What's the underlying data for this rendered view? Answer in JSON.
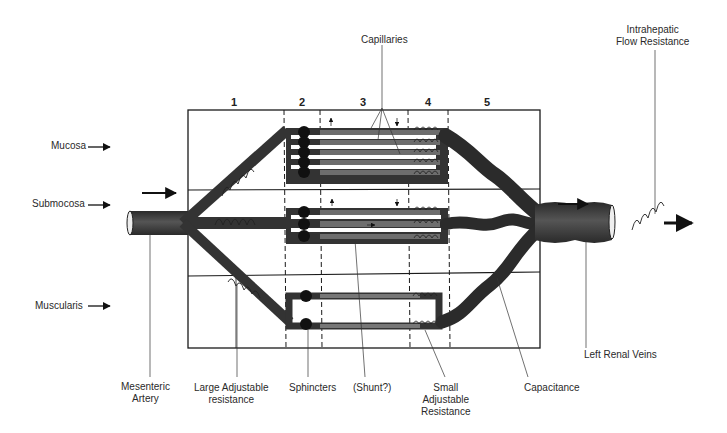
{
  "diagram": {
    "type": "schematic",
    "columns": [
      {
        "id": 1,
        "label": "1",
        "x": 234
      },
      {
        "id": 2,
        "label": "2",
        "x": 302
      },
      {
        "id": 3,
        "label": "3",
        "x": 363
      },
      {
        "id": 4,
        "label": "4",
        "x": 428
      },
      {
        "id": 5,
        "label": "5",
        "x": 487
      }
    ],
    "layers": [
      {
        "name": "Mucosa",
        "label": "Mucosa"
      },
      {
        "name": "Submucosa",
        "label": "Submocosa"
      },
      {
        "name": "Muscularis",
        "label": "Muscularis"
      }
    ],
    "top_labels": {
      "capillaries": "Capillaries",
      "intrahepatic_line1": "Intrahepatic",
      "intrahepatic_line2": "Flow Resistance"
    },
    "bottom_labels": {
      "mesenteric_line1": "Mesenteric",
      "mesenteric_line2": "Artery",
      "large_res_line1": "Large Adjustable",
      "large_res_line2": "resistance",
      "sphincters": "Sphincters",
      "shunt": "(Shunt?)",
      "small_res_line1": "Small",
      "small_res_line2": "Adjustable",
      "small_res_line3": "Resistance",
      "capacitance": "Capacitance",
      "left_renal_veins": "Left Renal Veins"
    },
    "colors": {
      "vessel": "#3a3a3a",
      "capillary": "#6a6a6a",
      "line": "#1a1a1a",
      "background": "#ffffff"
    }
  }
}
